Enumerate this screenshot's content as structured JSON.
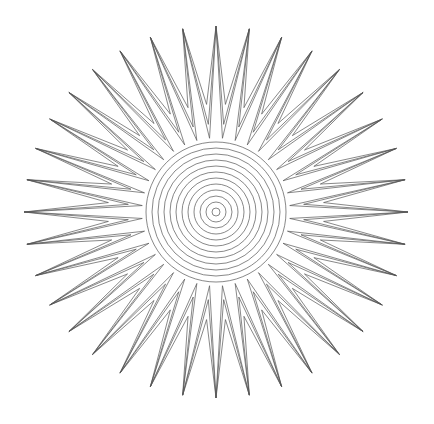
{
  "figure": {
    "width": 434,
    "height": 424,
    "background": "#ffffff",
    "stroke_color": "#555555",
    "stroke_width": 0.7,
    "center": [
      216,
      212
    ],
    "sun_rays": {
      "count": 36,
      "tip_radius_x": 192,
      "tip_radius_y": 186,
      "start_angle_deg": -90,
      "outlines": [
        {
          "valley_radius": 108
        },
        {
          "valley_radius": 88
        },
        {
          "valley_radius": 74
        }
      ]
    },
    "concentric_rings": {
      "count": 12,
      "outer_radius": 70,
      "inner_radius": 4
    }
  }
}
